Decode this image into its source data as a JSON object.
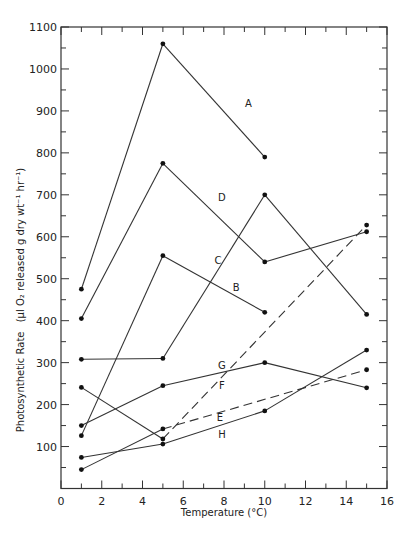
{
  "chart_data": {
    "type": "line",
    "title": "",
    "xlabel": "Temperature (°C)",
    "ylabel": "Photosynthetic Rate (µl O2 released g dry wt⁻¹ hr⁻¹)",
    "xlim": [
      0,
      16
    ],
    "ylim": [
      0,
      1100
    ],
    "xticks": [
      0,
      2,
      4,
      6,
      8,
      10,
      12,
      14,
      16
    ],
    "yticks": [
      100,
      200,
      300,
      400,
      500,
      600,
      700,
      800,
      900,
      1000,
      1100
    ],
    "grid": false,
    "legend": "inline labels",
    "series": [
      {
        "name": "A",
        "style": "solid",
        "x": [
          1,
          5,
          10
        ],
        "y": [
          475,
          1060,
          790
        ],
        "label_pos": [
          9.2,
          910
        ]
      },
      {
        "name": "B",
        "style": "solid",
        "x": [
          1,
          5,
          10
        ],
        "y": [
          126,
          555,
          420
        ],
        "label_pos": [
          8.6,
          470
        ]
      },
      {
        "name": "C",
        "style": "solid",
        "x": [
          1,
          5,
          10,
          15
        ],
        "y": [
          308,
          310,
          700,
          415
        ],
        "label_pos": [
          7.7,
          535
        ]
      },
      {
        "name": "D",
        "style": "solid",
        "x": [
          1,
          5,
          10,
          15
        ],
        "y": [
          405,
          775,
          540,
          612
        ],
        "label_pos": [
          7.9,
          685
        ]
      },
      {
        "name": "E",
        "style": "dashed-after-5",
        "x": [
          1,
          5,
          15
        ],
        "y": [
          45,
          142,
          283
        ],
        "label_pos": [
          7.8,
          160
        ]
      },
      {
        "name": "F",
        "style": "solid",
        "x": [
          1,
          5,
          10,
          15
        ],
        "y": [
          150,
          245,
          300,
          240
        ],
        "label_pos": [
          7.9,
          238
        ]
      },
      {
        "name": "G",
        "style": "dashed-after-5",
        "x": [
          1,
          5,
          15
        ],
        "y": [
          241,
          118,
          628
        ],
        "label_pos": [
          7.9,
          286
        ]
      },
      {
        "name": "H",
        "style": "solid",
        "x": [
          1,
          5,
          10,
          15
        ],
        "y": [
          74,
          106,
          185,
          330
        ],
        "label_pos": [
          7.9,
          120
        ]
      }
    ]
  },
  "axes": {
    "xlabel_text": "Temperature  (°C)",
    "ylabel_main": "Photosynthetic Rate",
    "ylabel_units": "(µl O₂ released   g dry wt⁻¹  hr⁻¹)"
  }
}
